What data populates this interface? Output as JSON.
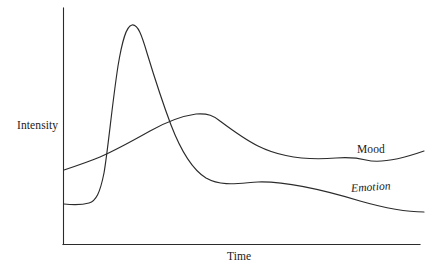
{
  "figure": {
    "background_color": "#ffffff",
    "ink_color": "#2b2b2b"
  },
  "axes": {
    "y_axis_title": "Intensity",
    "x_axis_title": "Time",
    "y_axis": {
      "x": 63,
      "y_top": 8,
      "y_bottom": 244
    },
    "x_axis": {
      "y": 244,
      "x_left": 63,
      "x_right": 420
    }
  },
  "series_labels": {
    "mood": "Mood",
    "emotion": "Emotion"
  },
  "chart_data": {
    "type": "line",
    "title": "",
    "subtitle": "",
    "xlabel": "Time",
    "ylabel": "Intensity",
    "xlim": [
      0,
      100
    ],
    "ylim": [
      0,
      100
    ],
    "grid": false,
    "axis_ticks": false,
    "tick_labels": {
      "x": [],
      "y": []
    },
    "legend": "inline-end-of-line",
    "legend_position": "right",
    "annotations": [
      {
        "text": "Emotion",
        "style": "italic",
        "attached_to": "emotion",
        "x": 88,
        "y": 25
      },
      {
        "text": "Mood",
        "style": "normal",
        "attached_to": "mood",
        "x": 90,
        "y": 43
      },
      {
        "text": "crossover",
        "style": "implicit",
        "attached_to": "both",
        "x": 32,
        "y": 53
      }
    ],
    "series": [
      {
        "name": "Emotion",
        "label_style": "italic",
        "color": "#2b2b2b",
        "description": "Low flat baseline, abrupt steep spike to a high narrow peak early, then rapid decay crossing the Mood curve, flattening into a long slow decline below Mood.",
        "x": [
          0,
          4,
          8,
          10,
          12,
          14,
          16,
          18,
          20,
          23,
          26,
          29,
          32,
          36,
          40,
          45,
          50,
          55,
          60,
          68,
          76,
          84,
          92,
          100
        ],
        "y": [
          17,
          17,
          18,
          21,
          30,
          52,
          75,
          89,
          93,
          90,
          80,
          66,
          53,
          41,
          33,
          28,
          26,
          25,
          23,
          20,
          17,
          15,
          13,
          12
        ]
      },
      {
        "name": "Mood",
        "label_style": "normal",
        "color": "#2b2b2b",
        "description": "Starts moderately low, rises steadily and smoothly to a broad rounded peak just after the crossover, then declines gradually to a shallow minimum near the right edge before turning slightly upward.",
        "x": [
          0,
          6,
          12,
          18,
          24,
          30,
          36,
          39,
          42,
          48,
          54,
          60,
          66,
          72,
          78,
          83,
          88,
          92,
          96,
          100
        ],
        "y": [
          31,
          34,
          38,
          43,
          49,
          53,
          55,
          55,
          55,
          53,
          50,
          46,
          43,
          40,
          37,
          36,
          36,
          37,
          38,
          39
        ]
      }
    ],
    "pixel_geometry": {
      "emotion_path": "M64,204 C74,205 82,205 89,203 C96,201 100,193 104,173 C108,150 112,105 118,66 C122,42 126,26 132,25 C138,24 142,36 147,53 C154,76 162,101 171,125 C181,151 193,170 206,178 C222,187 240,183 258,182 C290,181 330,192 360,201 C388,209 410,212 424,212",
      "mood_path": "M64,170 C76,166 88,162 100,157 C116,150 134,140 150,131 C166,122 182,116 196,114 C208,113 214,116 220,121 C232,130 244,139 258,146 C282,158 312,160 336,158 C350,157 358,158 366,160 C382,164 404,158 424,151"
    }
  }
}
